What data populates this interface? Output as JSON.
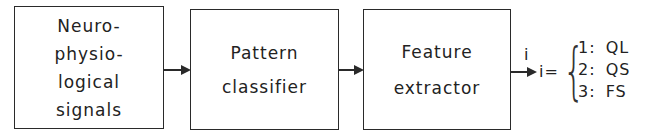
{
  "diagram": {
    "type": "block-flow",
    "blocks": [
      {
        "id": "neuro",
        "lines": [
          "Neuro-",
          "physio-",
          "logical",
          "signals"
        ]
      },
      {
        "id": "classifier",
        "lines": [
          "Pattern",
          "classifier"
        ]
      },
      {
        "id": "extractor",
        "lines": [
          "Feature",
          "extractor"
        ]
      }
    ],
    "output": {
      "arrow_label": "i",
      "equation_lhs": "i=",
      "brace": "{",
      "cases": [
        {
          "index": "1:",
          "label": "QL"
        },
        {
          "index": "2:",
          "label": "QS"
        },
        {
          "index": "3:",
          "label": "FS"
        }
      ]
    }
  }
}
